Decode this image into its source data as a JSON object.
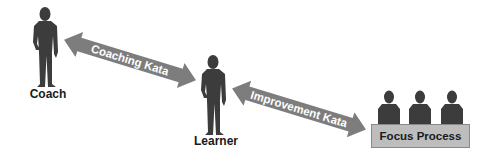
{
  "diagram": {
    "nodes": {
      "coach": {
        "label": "Coach"
      },
      "learner": {
        "label": "Learner"
      },
      "focus_process": {
        "label": "Focus Process",
        "people_count": 3
      }
    },
    "edges": [
      {
        "from": "coach",
        "to": "learner",
        "label": "Coaching Kata",
        "direction": "bidirectional"
      },
      {
        "from": "learner",
        "to": "focus_process",
        "label": "Improvement Kata",
        "direction": "bidirectional"
      }
    ]
  },
  "colors": {
    "figure": "#3c3c3c",
    "arrow": "#7d7d7d",
    "arrow_text": "#ffffff",
    "box_fill": "#bdbdbd",
    "box_border": "#8a8a8a",
    "label_text": "#1a1a1a"
  }
}
